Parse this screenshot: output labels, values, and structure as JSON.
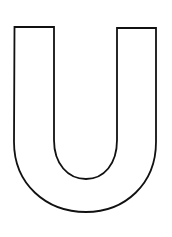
{
  "image": {
    "subject": "Letter U outline (coloring page)",
    "letter": "U",
    "background_color": "#ffffff",
    "stroke_color": "#111111",
    "fill_color": "#ffffff",
    "stroke_width": 2
  }
}
